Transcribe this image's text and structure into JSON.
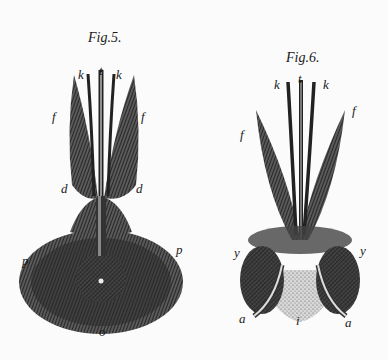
{
  "figures": [
    {
      "title": "Fig.5.",
      "labels": {
        "k_left": "k",
        "t": "t",
        "k_right": "k",
        "f_left": "f",
        "f_right": "f",
        "d_left": "d",
        "d_right": "d",
        "p_left": "p",
        "p_right": "p",
        "o": "o"
      }
    },
    {
      "title": "Fig.6.",
      "labels": {
        "k_left": "k",
        "t": "t",
        "k_right": "k",
        "f_left": "f",
        "f_right": "f",
        "y_left": "y",
        "y_right": "y",
        "a_left": "a",
        "a_right": "a",
        "i": "i"
      }
    }
  ],
  "colors": {
    "paper": "#fbfbfb",
    "ink": "#1a1a1a",
    "hatch": "#3a3a3a"
  }
}
